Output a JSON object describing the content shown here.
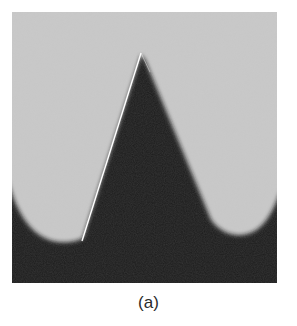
{
  "figure": {
    "caption": "(a)",
    "colors": {
      "background_light": "#c9c9c9",
      "material_dark": "#1a1a1a",
      "trace_line": "#ffffff",
      "page": "#ffffff"
    }
  }
}
